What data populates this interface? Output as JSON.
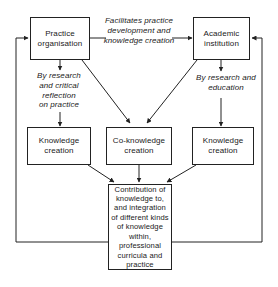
{
  "diagram": {
    "type": "flowchart",
    "title": "",
    "nodes": [
      {
        "id": "practice_organisation",
        "label": "Practice\norganisation"
      },
      {
        "id": "academic_institution",
        "label": "Academic\ninstitution"
      },
      {
        "id": "knowledge_creation_left",
        "label": "Knowledge\ncreation"
      },
      {
        "id": "co_knowledge_creation",
        "label": "Co-knowledge\ncreation"
      },
      {
        "id": "knowledge_creation_right",
        "label": "Knowledge\ncreation"
      },
      {
        "id": "contribution",
        "label": "Contribution of\nknowledge to,\nand integration\nof different kinds\nof knowledge\nwithin,\nprofessional\ncurricula and\npractice"
      }
    ],
    "edge_labels": [
      {
        "id": "facilitates",
        "text": "Facilitates practice\ndevelopment and\nknowledge creation"
      },
      {
        "id": "by_research_critical",
        "text": "By research\nand critical\nreflection\non practice"
      },
      {
        "id": "by_research_education",
        "text": "By research and\neducation"
      }
    ],
    "colors": {
      "stroke": "#222222",
      "background": "#ffffff",
      "text": "#1a1a1a"
    }
  }
}
